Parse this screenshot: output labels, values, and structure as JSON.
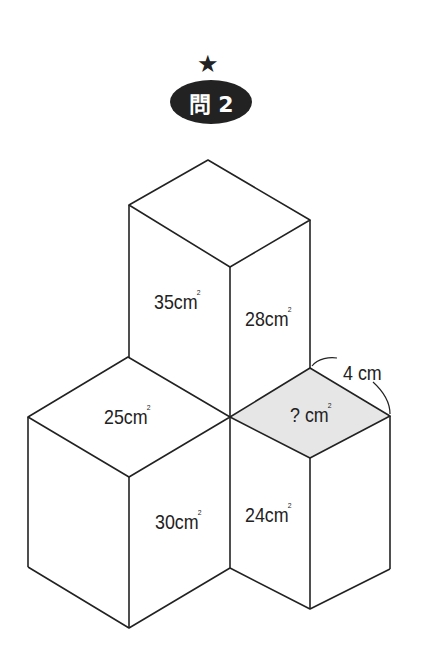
{
  "header": {
    "star": "★",
    "problem_label": "問 2"
  },
  "figure": {
    "faces": {
      "top_left_side": {
        "value": "35",
        "unit": "cm",
        "sup": "2"
      },
      "top_right_side": {
        "value": "28",
        "unit": "cm",
        "sup": "2"
      },
      "left_top": {
        "value": "25",
        "unit": "cm",
        "sup": "2"
      },
      "right_top_unknown": {
        "value": "? ",
        "unit": "cm",
        "sup": "2"
      },
      "left_front": {
        "value": "30",
        "unit": "cm",
        "sup": "2"
      },
      "right_front": {
        "value": "24",
        "unit": "cm",
        "sup": "2"
      }
    },
    "edge_label": "4 cm",
    "colors": {
      "line": "#222222",
      "shade": "#e6e6e6"
    }
  }
}
